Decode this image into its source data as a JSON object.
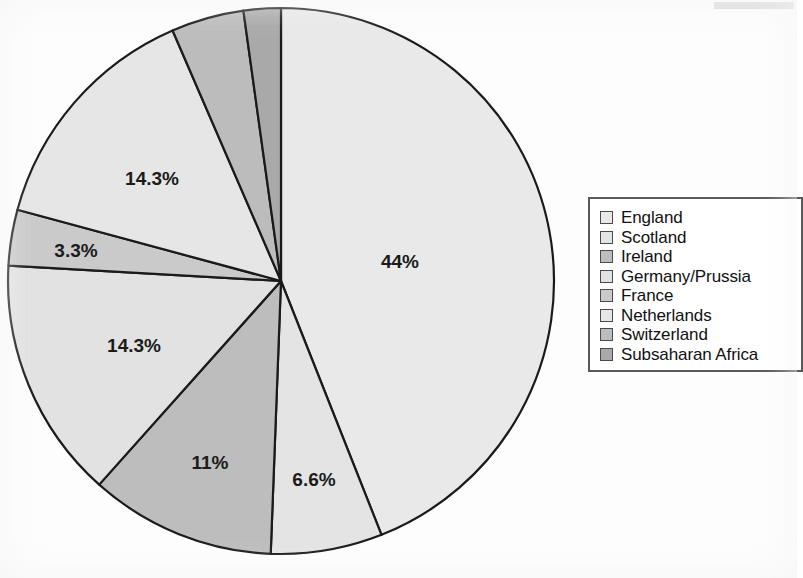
{
  "chart_data": {
    "type": "pie",
    "title": "",
    "categories": [
      "England",
      "Scotland",
      "Ireland",
      "Germany/Prussia",
      "France",
      "Netherlands",
      "Switzerland",
      "Subsaharan Africa"
    ],
    "values": [
      44,
      6.6,
      11,
      14.3,
      3.3,
      14.3,
      4.3,
      2.2
    ],
    "labels_shown": [
      "44%",
      "6.6%",
      "11%",
      "14.3%",
      "3.3%",
      "14.3%",
      "",
      ""
    ],
    "colors": [
      "#e9e9e9",
      "#e4e4e4",
      "#bdbdbd",
      "#e2e2e2",
      "#cacaca",
      "#e6e6e6",
      "#bcbcbc",
      "#a9a9a9"
    ],
    "start_angle_deg": 0,
    "direction": "clockwise",
    "grid": false,
    "legend_position": "right",
    "xlabel": "",
    "ylabel": ""
  },
  "pie": {
    "center_x": 281,
    "center_y": 281,
    "radius": 273,
    "stroke": "#1a1a1a",
    "stroke_width": 2.2,
    "slices": [
      {
        "name": "England",
        "percent": 44,
        "label": "44%",
        "color": "#e9e9e9",
        "label_x": 400,
        "label_y": 263
      },
      {
        "name": "Scotland",
        "percent": 6.6,
        "label": "6.6%",
        "color": "#e4e4e4",
        "label_x": 314,
        "label_y": 481
      },
      {
        "name": "Ireland",
        "percent": 11,
        "label": "11%",
        "color": "#bdbdbd",
        "label_x": 210,
        "label_y": 464
      },
      {
        "name": "Germany/Prussia",
        "percent": 14.3,
        "label": "14.3%",
        "color": "#e2e2e2",
        "label_x": 134,
        "label_y": 347
      },
      {
        "name": "France",
        "percent": 3.3,
        "label": "3.3%",
        "color": "#cacaca",
        "label_x": 76,
        "label_y": 252
      },
      {
        "name": "Netherlands",
        "percent": 14.3,
        "label": "14.3%",
        "color": "#e6e6e6",
        "label_x": 152,
        "label_y": 180
      },
      {
        "name": "Switzerland",
        "percent": 4.3,
        "label": "",
        "color": "#bcbcbc",
        "label_x": 218,
        "label_y": 60
      },
      {
        "name": "Subsaharan Africa",
        "percent": 2.2,
        "label": "",
        "color": "#a9a9a9",
        "label_x": 258,
        "label_y": 46
      }
    ]
  },
  "legend": {
    "items": [
      {
        "label": "England",
        "color": "#e9e9e9"
      },
      {
        "label": "Scotland",
        "color": "#e4e4e4"
      },
      {
        "label": "Ireland",
        "color": "#bdbdbd"
      },
      {
        "label": "Germany/Prussia",
        "color": "#e2e2e2"
      },
      {
        "label": "France",
        "color": "#cacaca"
      },
      {
        "label": "Netherlands",
        "color": "#e6e6e6"
      },
      {
        "label": "Switzerland",
        "color": "#bcbcbc"
      },
      {
        "label": "Subsaharan Africa",
        "color": "#a9a9a9"
      }
    ]
  }
}
